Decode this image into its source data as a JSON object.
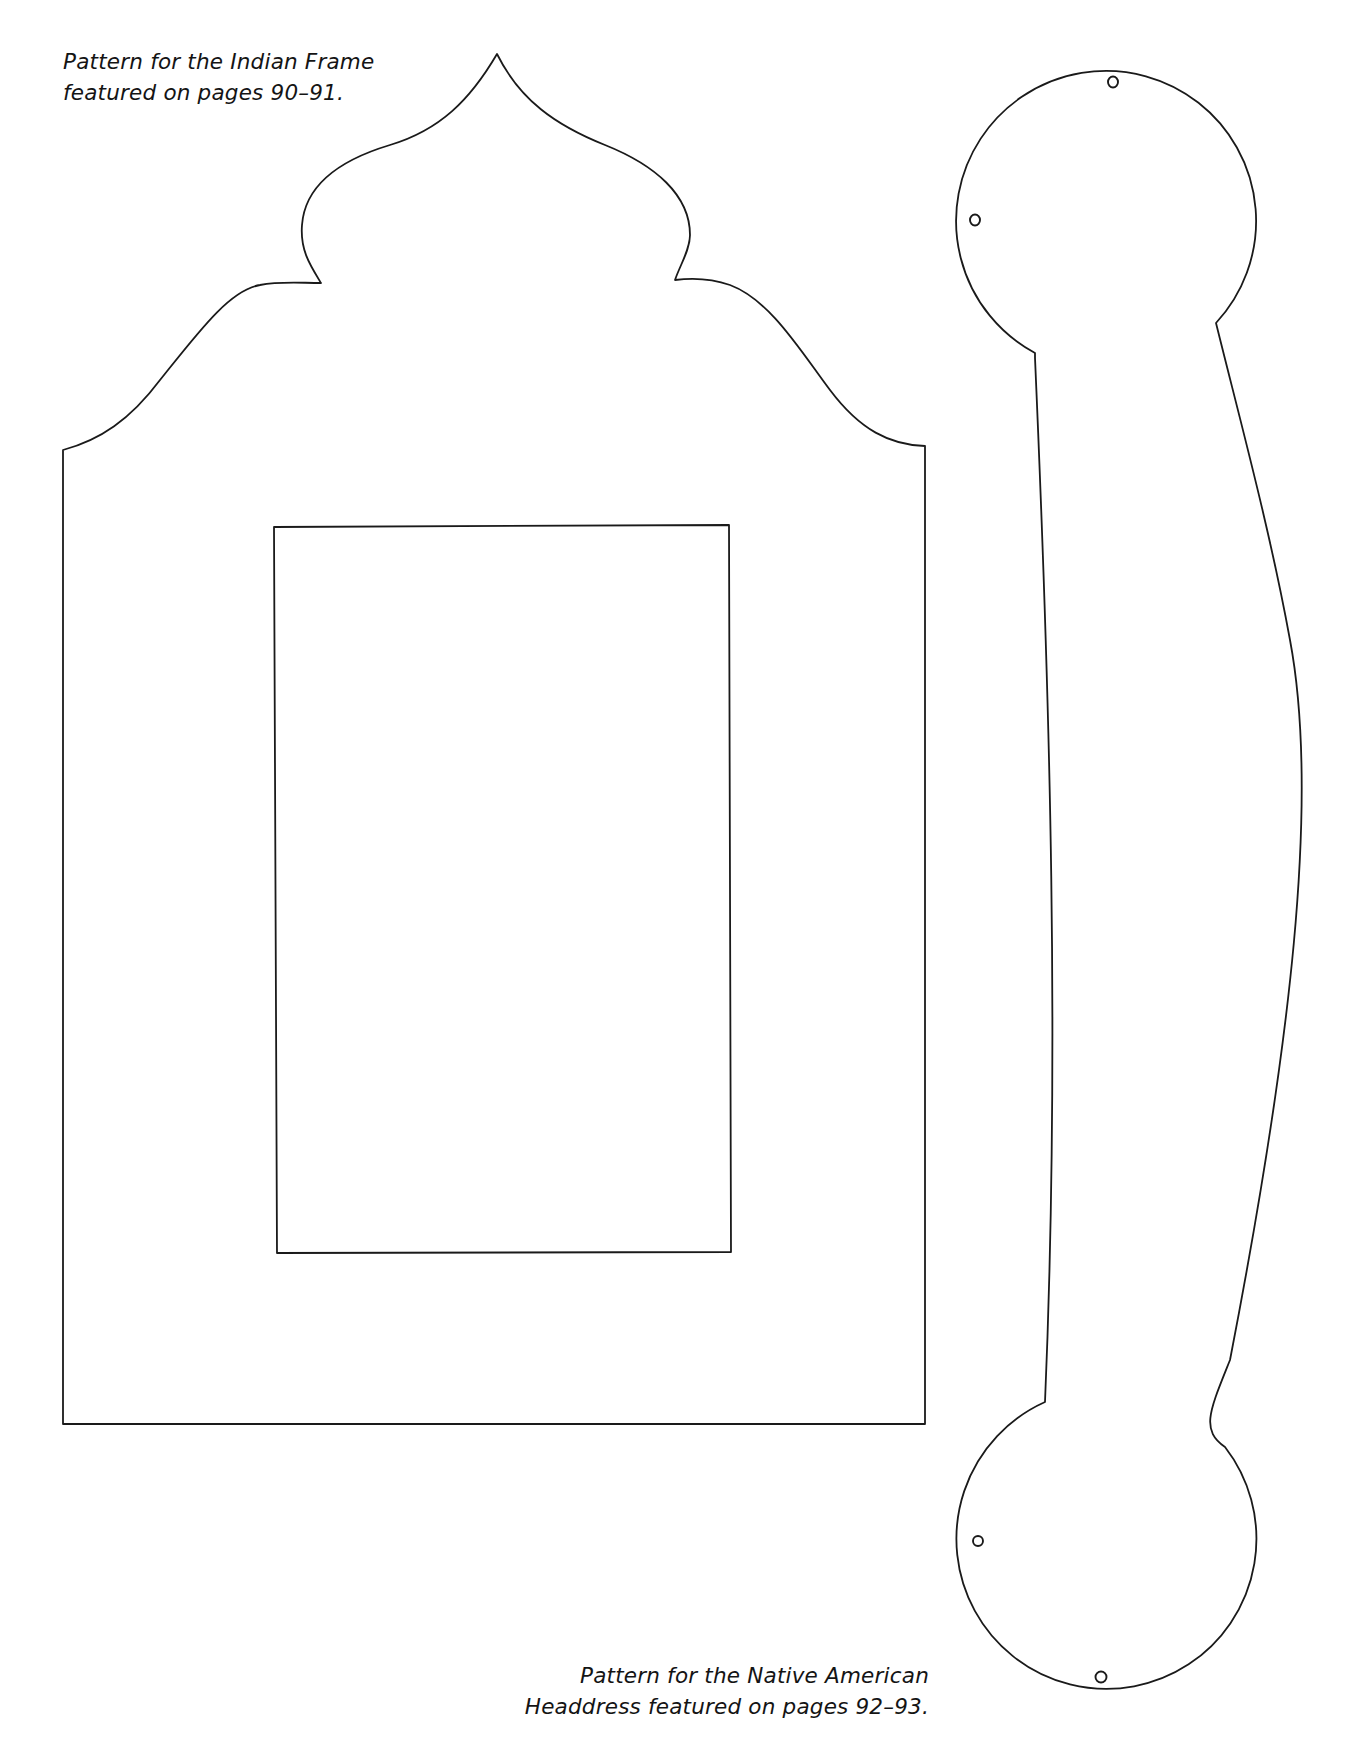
{
  "page": {
    "background": "#ffffff",
    "line_color": "#1a1a1a"
  },
  "captions": {
    "indian_frame": {
      "line1": "Pattern for the Indian Frame",
      "line2": "featured on pages 90–91."
    },
    "headdress": {
      "line1": "Pattern for the Native American",
      "line2": "Headdress featured on pages 92–93."
    }
  },
  "patterns": [
    {
      "name": "Indian Frame",
      "shape": "onion-dome arched frame with rectangular window"
    },
    {
      "name": "Native American Headdress",
      "shape": "curved band with circular ends and four punch holes"
    }
  ]
}
